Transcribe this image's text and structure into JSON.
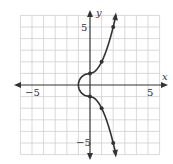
{
  "chart_data": {
    "type": "line",
    "title": "",
    "xlabel": "x",
    "ylabel": "y",
    "xlim": [
      -6,
      6
    ],
    "ylim": [
      -6,
      6
    ],
    "grid": true,
    "x_ticks": [
      {
        "value": -5,
        "label": "−5"
      },
      {
        "value": 5,
        "label": "5"
      }
    ],
    "y_ticks": [
      {
        "value": 5,
        "label": "5"
      },
      {
        "value": -5,
        "label": "−5"
      }
    ],
    "series": [
      {
        "name": "curve",
        "color": "#333333",
        "points": [
          {
            "x": 2.3,
            "y": 6.0
          },
          {
            "x": 2,
            "y": 5
          },
          {
            "x": 1,
            "y": 2
          },
          {
            "x": 0,
            "y": 1
          },
          {
            "x": -1,
            "y": 0
          },
          {
            "x": 0,
            "y": -1
          },
          {
            "x": 1,
            "y": -2
          },
          {
            "x": 2,
            "y": -5
          },
          {
            "x": 2.3,
            "y": -6.0
          }
        ],
        "marked_points": [
          {
            "x": 2,
            "y": 5
          },
          {
            "x": 1,
            "y": 2
          },
          {
            "x": 0,
            "y": 1
          },
          {
            "x": 0,
            "y": -1
          },
          {
            "x": 1,
            "y": -2
          },
          {
            "x": 2,
            "y": -5
          }
        ]
      }
    ]
  },
  "labels": {
    "x_axis": "x",
    "y_axis": "y",
    "x_neg5": "−5",
    "x_pos5": "5",
    "y_pos5": "5",
    "y_neg5": "−5"
  }
}
